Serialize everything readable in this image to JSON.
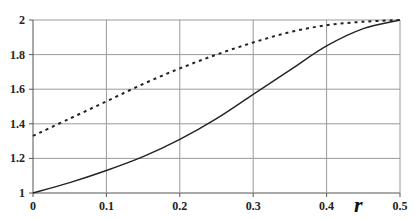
{
  "chart_data": {
    "type": "line",
    "title": "",
    "xlabel": "r",
    "ylabel": "",
    "xlim": [
      0,
      0.5
    ],
    "ylim": [
      1,
      2
    ],
    "grid": true,
    "legend": null,
    "x_ticks": [
      "0",
      "0.1",
      "0.2",
      "0.3",
      "0.4",
      "0.5"
    ],
    "y_ticks": [
      "1",
      "1.2",
      "1.4",
      "1.6",
      "1.8",
      "2"
    ],
    "x": [
      0,
      0.05,
      0.1,
      0.15,
      0.2,
      0.25,
      0.3,
      0.35,
      0.4,
      0.45,
      0.5
    ],
    "series": [
      {
        "name": "solid",
        "style": "solid",
        "color": "#222222",
        "values": [
          1.0,
          1.06,
          1.13,
          1.21,
          1.31,
          1.43,
          1.57,
          1.71,
          1.85,
          1.95,
          2.0
        ]
      },
      {
        "name": "dashed",
        "style": "dashed",
        "color": "#222222",
        "values": [
          1.33,
          1.43,
          1.53,
          1.63,
          1.72,
          1.8,
          1.87,
          1.93,
          1.97,
          1.99,
          2.0
        ]
      }
    ]
  }
}
